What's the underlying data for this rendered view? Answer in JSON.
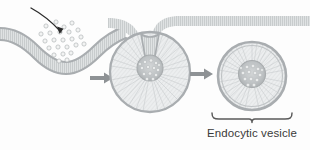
{
  "figure": {
    "background_color": "#fdfdfd",
    "membrane_color": "#a9adb0",
    "membrane_fill": "#d9dcdd",
    "interior_hatch_color": "#c3c7c9",
    "cargo_color": "#b9bdbf",
    "arrow_color": "#8e9295",
    "pointer_arrow_color": "#2b2b2b",
    "bracket_color": "#5a5a5a",
    "label_color": "#3a3a3a"
  },
  "labels": {
    "vesicle_label": "Endocytic vesicle"
  },
  "stages": [
    {
      "id": "stage-1",
      "name": "membrane-invagination",
      "cargo_particle_count": 24
    },
    {
      "id": "stage-2",
      "name": "budding-vesicle"
    },
    {
      "id": "stage-3",
      "name": "free-endocytic-vesicle"
    }
  ],
  "arrows": {
    "cargo_pointer": "curved-arrow-into-pit",
    "transition_1": "block-arrow-right",
    "transition_2": "block-arrow-right"
  }
}
